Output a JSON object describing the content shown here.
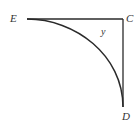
{
  "diagram": {
    "type": "geometry",
    "points": {
      "E": {
        "label": "E",
        "x": 27,
        "y": 19
      },
      "C": {
        "label": "C",
        "x": 123,
        "y": 19
      },
      "D": {
        "label": "D",
        "x": 123,
        "y": 107
      }
    },
    "labels": {
      "E": "E",
      "C": "C",
      "D": "D",
      "angle": "y"
    },
    "segments": [
      {
        "from": "E",
        "to": "C"
      },
      {
        "from": "C",
        "to": "D"
      }
    ],
    "arc": {
      "from": "E",
      "to": "D",
      "center": "near C"
    },
    "colors": {
      "stroke": "#2a2a2a",
      "label": "#333333",
      "background": "#ffffff"
    }
  }
}
